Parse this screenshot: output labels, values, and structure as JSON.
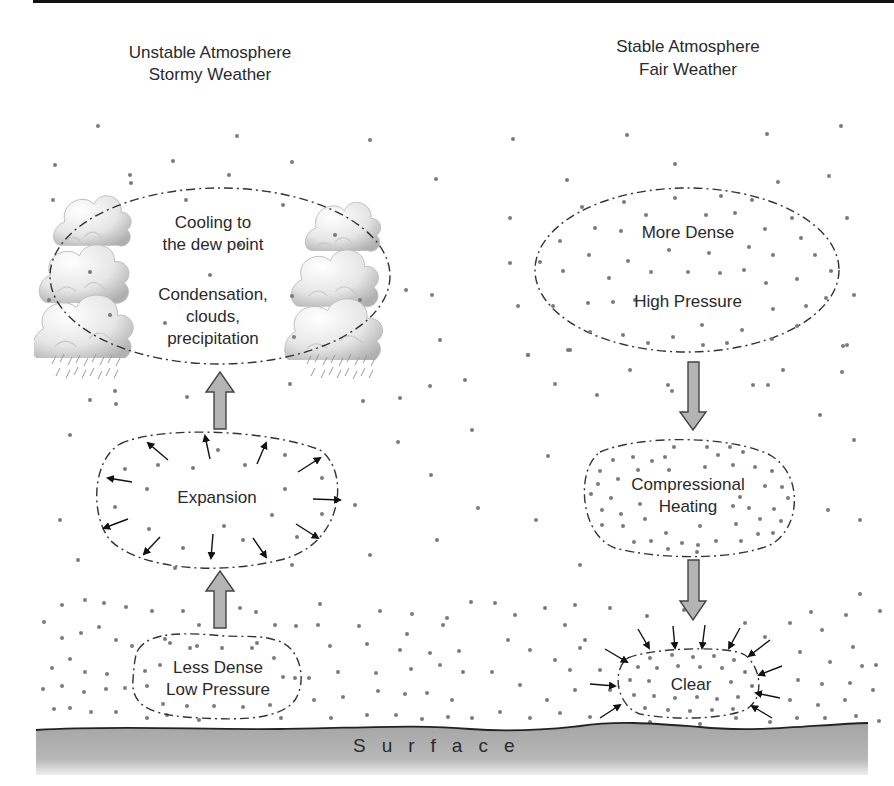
{
  "diagram": {
    "type": "atmospheric-stability-diagram",
    "left_panel": {
      "heading_line1": "Unstable Atmosphere",
      "heading_line2": "Stormy Weather",
      "top_region": {
        "line1": "Cooling to",
        "line2": "the dew point",
        "line3": "Condensation,",
        "line4": "clouds,",
        "line5": "precipitation"
      },
      "middle_region": {
        "label": "Expansion"
      },
      "bottom_region": {
        "line1": "Less Dense",
        "line2": "Low Pressure"
      },
      "arrow_direction": "up"
    },
    "right_panel": {
      "heading_line1": "Stable Atmosphere",
      "heading_line2": "Fair Weather",
      "top_region": {
        "line1": "More Dense",
        "line2": "High Pressure"
      },
      "middle_region": {
        "line1": "Compressional",
        "line2": "Heating"
      },
      "bottom_region": {
        "label": "Clear"
      },
      "arrow_direction": "down"
    },
    "ground": {
      "label": "Surface"
    },
    "colors": {
      "surface_fill": "#a9a9a9",
      "arrow_fill": "#b4b4b4",
      "dot": "#7a7a7a",
      "text": "#2a2a2a",
      "rule": "#111111"
    }
  }
}
